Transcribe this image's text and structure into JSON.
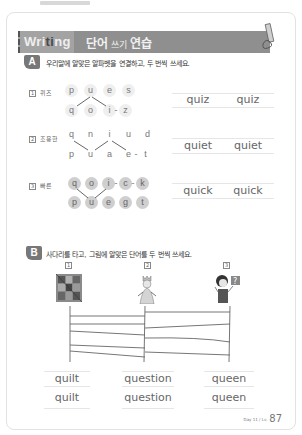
{
  "header": {
    "banner_en_pre": "Wri",
    "banner_en_hl": "ti",
    "banner_en_post": "ng",
    "banner_ko_a": "단어",
    "banner_ko_b": " 쓰기 ",
    "banner_ko_c": "연습",
    "icon": "pencil-icon"
  },
  "section_a": {
    "badge": "A",
    "instruction": "우리말에 알맞은 알파벳을 연결하고, 두 번씩 쓰세요.",
    "rows": [
      {
        "num": "1",
        "label": "퀴즈",
        "top_letters": [
          "p",
          "u",
          "e",
          "s"
        ],
        "bottom_letters": [
          "q",
          "o",
          "i",
          "-",
          "z"
        ],
        "answer": [
          "quiz",
          "quiz"
        ]
      },
      {
        "num": "2",
        "label": "조용한",
        "top_letters": [
          "q",
          "n",
          "i",
          "u",
          "d"
        ],
        "bottom_letters": [
          "p",
          "u",
          "a",
          "e",
          "-",
          "t"
        ],
        "answer": [
          "quiet",
          "quiet"
        ]
      },
      {
        "num": "3",
        "label": "빠른",
        "top_letters": [
          "q",
          "o",
          "i",
          "-",
          "c",
          "-",
          "k"
        ],
        "bottom_letters": [
          "p",
          "u",
          "e",
          "g",
          "t"
        ],
        "answer": [
          "quick",
          "quick"
        ]
      }
    ]
  },
  "section_b": {
    "badge": "B",
    "instruction": "사다리를 타고, 그림에 알맞은 단어를 두 번씩 쓰세요.",
    "pictures": [
      {
        "num": "1",
        "icon": "quilt-picture"
      },
      {
        "num": "2",
        "icon": "queen-picture"
      },
      {
        "num": "3",
        "icon": "question-person-picture"
      }
    ],
    "answers": [
      [
        "quilt",
        "quilt"
      ],
      [
        "question",
        "question"
      ],
      [
        "queen",
        "queen"
      ]
    ]
  },
  "footer": {
    "label": "Day 11 / Lv.",
    "page": "87"
  }
}
